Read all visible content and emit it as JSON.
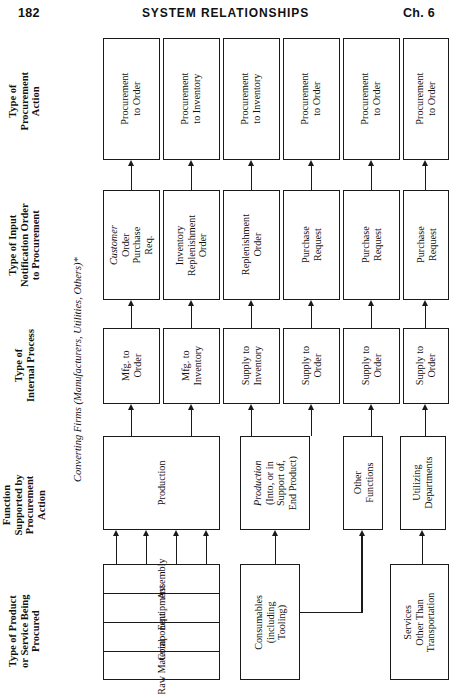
{
  "running_head": {
    "folio": "182",
    "title": "SYSTEM RELATIONSHIPS",
    "chapter": "Ch. 6"
  },
  "band_labels": [
    {
      "id": "type-of-procurement-action",
      "text": "Type of\nProcurement\nAction"
    },
    {
      "id": "type-of-input-notification-order",
      "text": "Type of Input\nNotification Order\nto Procurement"
    },
    {
      "id": "type-of-internal-process",
      "text": "Type of\nInternal Process"
    },
    {
      "id": "function-supported",
      "text": "Function\nSupported by\nProcurement\nAction"
    },
    {
      "id": "type-of-product-or-service",
      "text": "Type of Product\nor Service Being\nProcured"
    }
  ],
  "side_caption": "Converting Firms (Manufacturers, Utilities, Others)*",
  "rows": {
    "procurement_action": [
      "Procurement\nto Order",
      "Procurement\nto Inventory",
      "Procurement\nto Inventory",
      "Procurement\nto Order",
      "Procurement\nto Order",
      "Procurement\nto Order"
    ],
    "input_notification": [
      "Customer Order\nPurchase Req.",
      "Inventory\nReplenishment\nOrder",
      "Replenishment\nOrder",
      "Purchase\nRequest",
      "Purchase\nRequest",
      "Purchase\nRequest"
    ],
    "internal_process": [
      "Mfg. to\nOrder",
      "Mfg. to\nInventory",
      "Supply to\nInventory",
      "Supply to\nOrder",
      "Supply to\nOrder",
      "Supply to\nOrder"
    ],
    "function_supported": [
      "Production",
      "Production\n(Into, or in\nSupport of,\nEnd Product)",
      "Other\nFunctions",
      "Utilizing\nDepartments"
    ],
    "product_or_service": [
      "Assembly",
      "Equipment",
      "Component",
      "Raw Material",
      "Consumables\n(including\nTooling)",
      "Services\nOther Than\nTransportation"
    ]
  },
  "colors": {
    "ink": "#1a1a1a",
    "paper": "#ffffff"
  }
}
